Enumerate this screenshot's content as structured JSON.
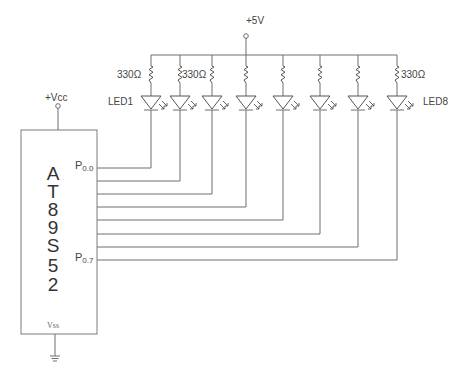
{
  "diagram": {
    "supply": {
      "label": "+5V"
    },
    "mcu_supply": {
      "label": "+Vcc"
    },
    "chip": {
      "letters": [
        "A",
        "T",
        "8",
        "9",
        "S",
        "5",
        "2"
      ],
      "name": "AT89S52",
      "pin_first": {
        "base": "P",
        "sub": "0.0"
      },
      "pin_last": {
        "base": "P",
        "sub": "0.7"
      },
      "ground_pin": "Vss"
    },
    "resistor_labels": [
      {
        "text": "330Ω",
        "position": "left of LED1 resistor"
      },
      {
        "text": "330Ω",
        "position": "left of LED3 resistor"
      },
      {
        "text": "330Ω",
        "position": "right of LED8 resistor"
      }
    ],
    "led_labels": {
      "first": "LED1",
      "last": "LED8"
    },
    "leds": [
      {
        "name": "LED1",
        "x": 151,
        "pin": "P0.0"
      },
      {
        "name": "LED2",
        "x": 180,
        "pin": "P0.1"
      },
      {
        "name": "LED3",
        "x": 212,
        "pin": "P0.2"
      },
      {
        "name": "LED4",
        "x": 246,
        "pin": "P0.3"
      },
      {
        "name": "LED5",
        "x": 283,
        "pin": "P0.4"
      },
      {
        "name": "LED6",
        "x": 320,
        "pin": "P0.5"
      },
      {
        "name": "LED7",
        "x": 358,
        "pin": "P0.6"
      },
      {
        "name": "LED8",
        "x": 397,
        "pin": "P0.7"
      }
    ],
    "colors": {
      "wire": "#6e6e6e",
      "text": "#444444",
      "background": "#ffffff"
    }
  }
}
